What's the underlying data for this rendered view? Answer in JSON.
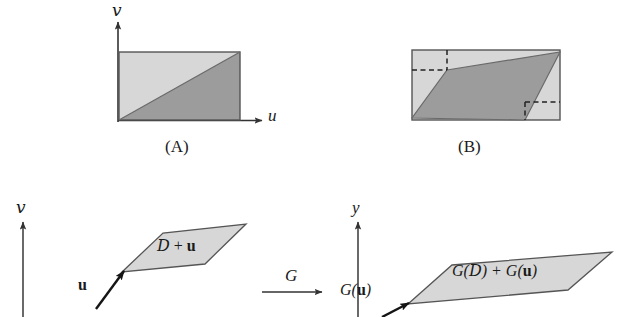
{
  "figure": {
    "panels": [
      {
        "id": "panel-a",
        "caption": "(A)",
        "axis_vertical_label": "v",
        "axis_horizontal_label": "u",
        "description": "rectangle divided by diagonal into light upper-left triangle and dark lower-right triangle"
      },
      {
        "id": "panel-b",
        "caption": "(B)",
        "description": "rectangle with inscribed dark parallelogram and dashed guide lines"
      }
    ],
    "lower": {
      "left": {
        "axis_vertical_label": "v",
        "vector_label": "u",
        "region_label_parts": {
          "script_d": "D",
          "plus": " + ",
          "vector": "u"
        }
      },
      "middle": {
        "map_label": "G"
      },
      "right": {
        "axis_vertical_label": "y",
        "vector_label_parts": {
          "g_open": "G(",
          "vector": "u",
          "g_close": ")"
        },
        "region_label_parts": {
          "g_open": "G(",
          "script_d": "D",
          "g_close": ") + ",
          "g_open2": "G(",
          "vector": "u",
          "g_close2": ")"
        }
      }
    },
    "colors": {
      "light_gray": "#d7d7d7",
      "dark_gray": "#9c9c9c",
      "stroke": "#4a4a4a",
      "text": "#1a1a1a"
    }
  }
}
